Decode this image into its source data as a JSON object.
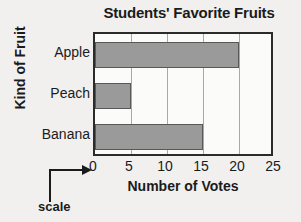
{
  "chart_data": {
    "type": "bar",
    "orientation": "horizontal",
    "title": "Students' Favorite Fruits",
    "xlabel": "Number of Votes",
    "ylabel": "Kind of Fruit",
    "categories": [
      "Apple",
      "Peach",
      "Banana"
    ],
    "values": [
      20,
      5,
      15
    ],
    "xlim": [
      0,
      25
    ],
    "xticks": [
      0,
      5,
      10,
      15,
      20,
      25
    ],
    "xtick_labels": [
      "0",
      "5",
      "10",
      "15",
      "20",
      "25"
    ],
    "grid": true,
    "grid_axis": "x",
    "legend": false,
    "annotations": [
      {
        "text": "scale",
        "points_to": "x-axis-tick-0",
        "style": "elbow-arrow"
      }
    ],
    "colors": {
      "bar_fill": "#9a9a9a",
      "bar_edge": "#585858",
      "plot_background": "#fbfbfa",
      "plot_border": "#2b2b2b",
      "gridline": "#a8a8a8",
      "page_background": "#f1f0ee",
      "text": "#1b1b1b"
    }
  }
}
